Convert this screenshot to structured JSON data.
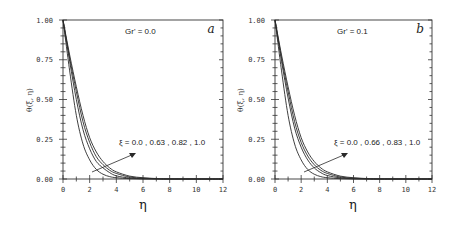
{
  "chart_data": [
    {
      "type": "line",
      "panel": "a",
      "annotation_param": "Gr' = 0.0",
      "title": "",
      "xlabel": "η",
      "ylabel": "θ(ξ, η)",
      "xlim": [
        0,
        12
      ],
      "ylim": [
        0,
        1
      ],
      "xticks": [
        "0",
        "2",
        "4",
        "6",
        "8",
        "10",
        "12"
      ],
      "yticks": [
        "0.00",
        "0.25",
        "0.50",
        "0.75",
        "1.00"
      ],
      "grid": false,
      "legend_annotation": "ξ = 0.0 , 0.63 , 0.82 , 1.0",
      "x": [
        0,
        0.5,
        1,
        1.5,
        2,
        2.5,
        3,
        3.5,
        4,
        5,
        6,
        7,
        8,
        12
      ],
      "series": [
        {
          "name": "ξ = 0.0",
          "values": [
            1.0,
            0.68,
            0.4,
            0.22,
            0.12,
            0.06,
            0.03,
            0.015,
            0.008,
            0.002,
            0.0,
            0.0,
            0.0,
            0.0
          ]
        },
        {
          "name": "ξ = 0.63",
          "values": [
            1.0,
            0.74,
            0.5,
            0.31,
            0.19,
            0.11,
            0.07,
            0.04,
            0.02,
            0.006,
            0.002,
            0.0,
            0.0,
            0.0
          ]
        },
        {
          "name": "ξ = 0.82",
          "values": [
            1.0,
            0.76,
            0.55,
            0.36,
            0.23,
            0.14,
            0.09,
            0.055,
            0.035,
            0.012,
            0.005,
            0.002,
            0.0,
            0.0
          ]
        },
        {
          "name": "ξ = 1.0",
          "values": [
            1.0,
            0.78,
            0.58,
            0.4,
            0.26,
            0.17,
            0.11,
            0.07,
            0.045,
            0.018,
            0.008,
            0.003,
            0.001,
            0.0
          ]
        }
      ]
    },
    {
      "type": "line",
      "panel": "b",
      "annotation_param": "Gr' = 0.1",
      "title": "",
      "xlabel": "η",
      "ylabel": "θ(ξ, η)",
      "xlim": [
        0,
        12
      ],
      "ylim": [
        0,
        1
      ],
      "xticks": [
        "0",
        "2",
        "4",
        "6",
        "8",
        "10",
        "12"
      ],
      "yticks": [
        "0.00",
        "0.25",
        "0.50",
        "0.75",
        "1.00"
      ],
      "grid": false,
      "legend_annotation": "ξ = 0.0 , 0.66 , 0.83 , 1.0",
      "x": [
        0,
        0.5,
        1,
        1.5,
        2,
        2.5,
        3,
        3.5,
        4,
        5,
        6,
        7,
        8,
        12
      ],
      "series": [
        {
          "name": "ξ = 0.0",
          "values": [
            1.0,
            0.68,
            0.4,
            0.22,
            0.12,
            0.06,
            0.03,
            0.015,
            0.008,
            0.002,
            0.0,
            0.0,
            0.0,
            0.0
          ]
        },
        {
          "name": "ξ = 0.66",
          "values": [
            1.0,
            0.74,
            0.51,
            0.32,
            0.2,
            0.12,
            0.07,
            0.04,
            0.022,
            0.007,
            0.002,
            0.0,
            0.0,
            0.0
          ]
        },
        {
          "name": "ξ = 0.83",
          "values": [
            1.0,
            0.76,
            0.55,
            0.36,
            0.23,
            0.145,
            0.09,
            0.055,
            0.035,
            0.012,
            0.005,
            0.002,
            0.0,
            0.0
          ]
        },
        {
          "name": "ξ = 1.0",
          "values": [
            1.0,
            0.78,
            0.58,
            0.4,
            0.26,
            0.17,
            0.11,
            0.07,
            0.045,
            0.018,
            0.008,
            0.003,
            0.001,
            0.0
          ]
        }
      ]
    }
  ],
  "panels": {
    "a": {
      "tag": "a",
      "param_label": "Gr' = 0.0",
      "curve_label": "ξ = 0.0 , 0.63 , 0.82 , 1.0",
      "ylabel": "θ(ξ, η)",
      "xlabel": "η"
    },
    "b": {
      "tag": "b",
      "param_label": "Gr' = 0.1",
      "curve_label": "ξ = 0.0 , 0.66 , 0.83 , 1.0",
      "ylabel": "θ(ξ, η)",
      "xlabel": "η"
    }
  },
  "colors": {
    "line": "#2a2a2a",
    "axis": "#333333",
    "background": "#ffffff"
  }
}
